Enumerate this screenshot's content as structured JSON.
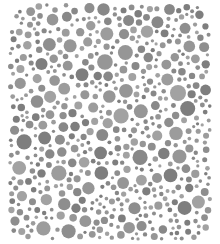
{
  "image": {
    "description": "Grayscale dot-pattern color-vision test plate",
    "width": 220,
    "height": 244,
    "background": "#ffffff"
  },
  "plate": {
    "bounds": {
      "x": 8,
      "y": 3,
      "w": 204,
      "h": 238
    },
    "corner_radius": {
      "tl": 30,
      "tr": 26,
      "br": 22,
      "bl": 14
    },
    "dot_colors": [
      "#8e8e8e",
      "#969696",
      "#9c9c9c",
      "#888888",
      "#7e7e7e",
      "#a2a2a2"
    ],
    "dot_radius": {
      "min": 1.6,
      "max": 8.2
    },
    "seed": 7319,
    "attempts": 9000,
    "gap": 1.3
  }
}
